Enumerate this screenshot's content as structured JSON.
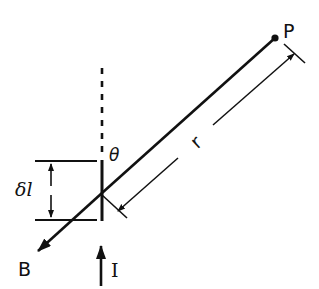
{
  "diagram": {
    "labels": {
      "point": "P",
      "distance": "r",
      "angle": "θ",
      "element_length": "δl",
      "field": "B",
      "current": "I"
    },
    "colors": {
      "ink": "#111111",
      "background": "#ffffff"
    }
  }
}
